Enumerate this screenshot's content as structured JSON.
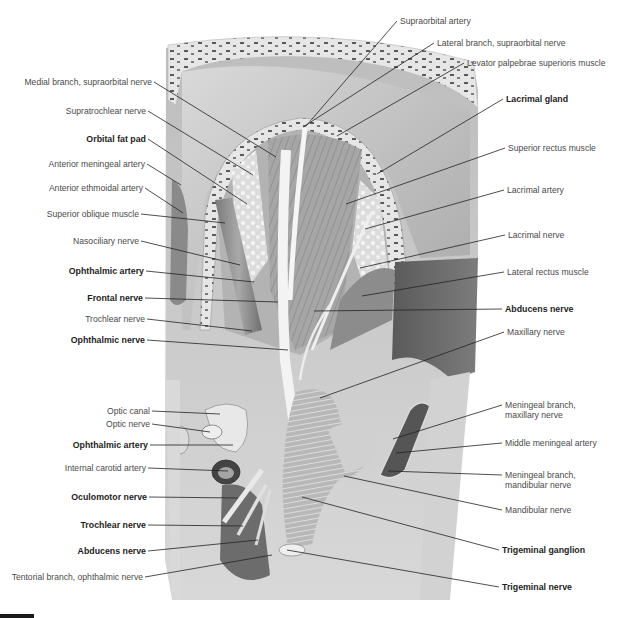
{
  "figure": {
    "type": "anatomical-illustration",
    "style": "grayscale pencil illustration"
  },
  "labels_left": [
    {
      "id": "medial-branch-supraorbital-nerve",
      "text": "Medial branch, supraorbital nerve",
      "bold": false,
      "x": 152,
      "y": 82,
      "tx": 276,
      "ty": 157
    },
    {
      "id": "supratrochlear-nerve",
      "text": "Supratrochlear nerve",
      "bold": false,
      "x": 146,
      "y": 111,
      "tx": 253,
      "ty": 175
    },
    {
      "id": "orbital-fat-pad",
      "text": "Orbital fat pad",
      "bold": true,
      "x": 146,
      "y": 139,
      "tx": 247,
      "ty": 204
    },
    {
      "id": "anterior-meningeal-artery",
      "text": "Anterior meningeal artery",
      "bold": false,
      "x": 145,
      "y": 164,
      "tx": 181,
      "ty": 185
    },
    {
      "id": "anterior-ethmoidal-artery",
      "text": "Anterior ethmoidal artery",
      "bold": false,
      "x": 143,
      "y": 188,
      "tx": 183,
      "ty": 213
    },
    {
      "id": "superior-oblique-muscle",
      "text": "Superior oblique muscle",
      "bold": false,
      "x": 139,
      "y": 214,
      "tx": 225,
      "ty": 223
    },
    {
      "id": "nasociliary-nerve",
      "text": "Nasociliary nerve",
      "bold": false,
      "x": 139,
      "y": 241,
      "tx": 240,
      "ty": 265
    },
    {
      "id": "ophthalmic-artery-upper",
      "text": "Ophthalmic artery",
      "bold": true,
      "x": 144,
      "y": 271,
      "tx": 254,
      "ty": 282
    },
    {
      "id": "frontal-nerve",
      "text": "Frontal nerve",
      "bold": true,
      "x": 143,
      "y": 298,
      "tx": 278,
      "ty": 302
    },
    {
      "id": "trochlear-nerve-upper",
      "text": "Trochlear nerve",
      "bold": false,
      "x": 145,
      "y": 319,
      "tx": 252,
      "ty": 331
    },
    {
      "id": "ophthalmic-nerve",
      "text": "Ophthalmic nerve",
      "bold": true,
      "x": 145,
      "y": 340,
      "tx": 288,
      "ty": 350
    },
    {
      "id": "optic-canal",
      "text": "Optic canal",
      "bold": false,
      "x": 150,
      "y": 411,
      "tx": 220,
      "ty": 414
    },
    {
      "id": "optic-nerve",
      "text": "Optic nerve",
      "bold": false,
      "x": 150,
      "y": 424,
      "tx": 210,
      "ty": 432
    },
    {
      "id": "ophthalmic-artery-lower",
      "text": "Ophthalmic artery",
      "bold": true,
      "x": 148,
      "y": 445,
      "tx": 233,
      "ty": 445
    },
    {
      "id": "internal-carotid-artery",
      "text": "Internal carotid artery",
      "bold": false,
      "x": 146,
      "y": 468,
      "tx": 228,
      "ty": 471
    },
    {
      "id": "oculomotor-nerve",
      "text": "Oculomotor nerve",
      "bold": true,
      "x": 147,
      "y": 497,
      "tx": 238,
      "ty": 498
    },
    {
      "id": "trochlear-nerve-lower",
      "text": "Trochlear nerve",
      "bold": true,
      "x": 146,
      "y": 525,
      "tx": 243,
      "ty": 526
    },
    {
      "id": "abducens-nerve-lower",
      "text": "Abducens nerve",
      "bold": true,
      "x": 146,
      "y": 551,
      "tx": 258,
      "ty": 540
    },
    {
      "id": "tentorial-branch-ophthalmic-nerve",
      "text": "Tentorial branch, ophthalmic nerve",
      "bold": false,
      "x": 143,
      "y": 577,
      "tx": 272,
      "ty": 555
    }
  ],
  "labels_right": [
    {
      "id": "supraorbital-artery",
      "text": "Supraorbital artery",
      "bold": false,
      "x": 400,
      "y": 21,
      "tx": 306,
      "ty": 126
    },
    {
      "id": "lateral-branch-supraorbital-nerve",
      "text": "Lateral branch, supraorbital nerve",
      "bold": false,
      "x": 437,
      "y": 43,
      "tx": 303,
      "ty": 127
    },
    {
      "id": "levator-palpebrae-superioris-muscle",
      "text": "Levator palpebrae superioris muscle",
      "bold": false,
      "x": 467,
      "y": 63,
      "tx": 337,
      "ty": 136
    },
    {
      "id": "lacrimal-gland",
      "text": "Lacrimal gland",
      "bold": true,
      "x": 506,
      "y": 99,
      "tx": 377,
      "ty": 174
    },
    {
      "id": "superior-rectus-muscle",
      "text": "Superior rectus muscle",
      "bold": false,
      "x": 508,
      "y": 148,
      "tx": 346,
      "ty": 204
    },
    {
      "id": "lacrimal-artery",
      "text": "Lacrimal artery",
      "bold": false,
      "x": 507,
      "y": 190,
      "tx": 365,
      "ty": 229
    },
    {
      "id": "lacrimal-nerve",
      "text": "Lacrimal nerve",
      "bold": false,
      "x": 508,
      "y": 235,
      "tx": 360,
      "ty": 268
    },
    {
      "id": "lateral-rectus-muscle",
      "text": "Lateral rectus muscle",
      "bold": false,
      "x": 507,
      "y": 272,
      "tx": 362,
      "ty": 296
    },
    {
      "id": "abducens-nerve-upper",
      "text": "Abducens nerve",
      "bold": true,
      "x": 505,
      "y": 309,
      "tx": 314,
      "ty": 311
    },
    {
      "id": "maxillary-nerve",
      "text": "Maxillary nerve",
      "bold": false,
      "x": 507,
      "y": 332,
      "tx": 320,
      "ty": 398
    },
    {
      "id": "meningeal-branch-maxillary-nerve",
      "text": "Meningeal branch, maxillary nerve",
      "bold": false,
      "x": 505,
      "y": 405,
      "tx": 393,
      "ty": 439,
      "multiline": true
    },
    {
      "id": "middle-meningeal-artery",
      "text": "Middle meningeal artery",
      "bold": false,
      "x": 505,
      "y": 443,
      "tx": 396,
      "ty": 453
    },
    {
      "id": "meningeal-branch-mandibular-nerve",
      "text": "Meningeal branch, mandibular nerve",
      "bold": false,
      "x": 505,
      "y": 475,
      "tx": 388,
      "ty": 471,
      "multiline": true
    },
    {
      "id": "mandibular-nerve",
      "text": "Mandibular nerve",
      "bold": false,
      "x": 505,
      "y": 510,
      "tx": 344,
      "ty": 476
    },
    {
      "id": "trigeminal-ganglion",
      "text": "Trigeminal ganglion",
      "bold": true,
      "x": 502,
      "y": 550,
      "tx": 302,
      "ty": 497
    },
    {
      "id": "trigeminal-nerve",
      "text": "Trigeminal nerve",
      "bold": true,
      "x": 502,
      "y": 587,
      "tx": 287,
      "ty": 550
    }
  ],
  "colors": {
    "background": "#ffffff",
    "label_text": "#4a4a4a",
    "label_bold_text": "#1e1e1e",
    "leader_line": "#222222",
    "bone": "#e9e9e9",
    "dura_light": "#cfcfcf",
    "dura_dark": "#6e6e6e",
    "muscle": "#9a9a9a",
    "nerve": "#f2f2f2"
  }
}
